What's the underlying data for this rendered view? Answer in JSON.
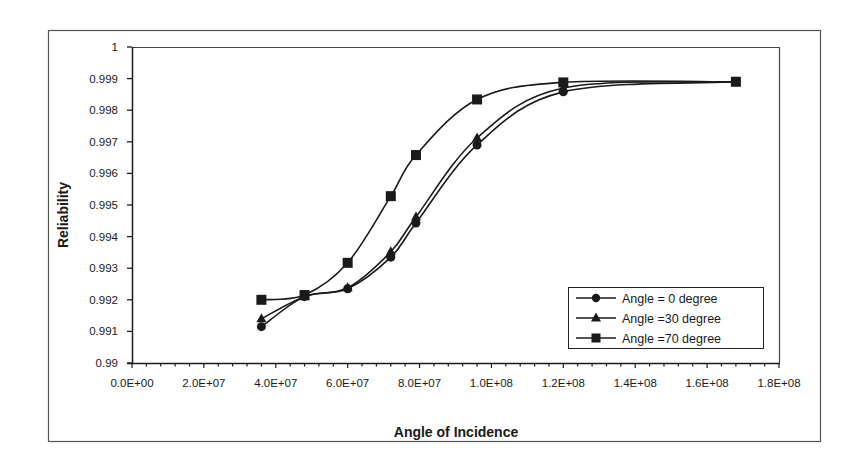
{
  "chart_data": {
    "type": "line",
    "title": "",
    "xlabel": "Angle of Incidence",
    "ylabel": "Reliability",
    "xlim": [
      0,
      180000000
    ],
    "ylim": [
      0.99,
      1.0
    ],
    "x_ticks": [
      "0.0E+00",
      "2.0E+07",
      "4.0E+07",
      "6.0E+07",
      "8.0E+07",
      "1.0E+08",
      "1.2E+08",
      "1.4E+08",
      "1.6E+08",
      "1.8E+08"
    ],
    "y_ticks": [
      "0.99",
      "0.991",
      "0.992",
      "0.993",
      "0.994",
      "0.995",
      "0.996",
      "0.997",
      "0.998",
      "0.999",
      "1"
    ],
    "grid": false,
    "smoothed": true,
    "legend_position": "lower right, inside plot",
    "series": [
      {
        "name": "Angle = 0 degree",
        "marker": "circle",
        "x": [
          36000000,
          48000000,
          60000000,
          72000000,
          79000000,
          96000000,
          120000000,
          168000000
        ],
        "values": [
          0.99115,
          0.9921,
          0.99235,
          0.99335,
          0.99443,
          0.9969,
          0.99858,
          0.9989
        ]
      },
      {
        "name": "Angle =30 degree",
        "marker": "triangle",
        "x": [
          36000000,
          48000000,
          60000000,
          72000000,
          79000000,
          96000000,
          120000000,
          168000000
        ],
        "values": [
          0.9914,
          0.9921,
          0.99238,
          0.99352,
          0.99462,
          0.99712,
          0.9987,
          0.9989
        ]
      },
      {
        "name": "Angle =70 degree",
        "marker": "square",
        "x": [
          36000000,
          48000000,
          60000000,
          72000000,
          79000000,
          96000000,
          120000000,
          168000000
        ],
        "values": [
          0.992,
          0.99215,
          0.99317,
          0.99528,
          0.99658,
          0.99834,
          0.99888,
          0.9989
        ]
      }
    ]
  },
  "colors": {
    "ink": "#1a1a1a",
    "frame": "#555555",
    "background": "#ffffff"
  }
}
